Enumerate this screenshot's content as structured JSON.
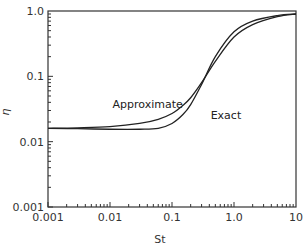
{
  "chart_data": {
    "type": "line",
    "title": "",
    "xlabel": "St",
    "ylabel": "η",
    "xscale": "log",
    "yscale": "log",
    "xlim": [
      0.001,
      10
    ],
    "ylim": [
      0.001,
      1.0
    ],
    "x_ticks": [
      0.001,
      0.01,
      0.1,
      1.0,
      10
    ],
    "x_tick_labels": [
      "0.001",
      "0.01",
      "0.1",
      "1.0",
      "10"
    ],
    "y_ticks": [
      0.001,
      0.01,
      0.1,
      1.0
    ],
    "y_tick_labels": [
      "0.001",
      "0.01",
      "0.1",
      "1.0"
    ],
    "grid": false,
    "legend": "none (curves annotated inline)",
    "series": [
      {
        "name": "Approximate",
        "x": [
          0.001,
          0.003,
          0.01,
          0.03,
          0.06,
          0.1,
          0.15,
          0.2,
          0.3,
          0.5,
          1.0,
          2.0,
          5.0,
          10
        ],
        "y": [
          0.016,
          0.0163,
          0.017,
          0.019,
          0.022,
          0.027,
          0.036,
          0.047,
          0.08,
          0.17,
          0.4,
          0.62,
          0.82,
          0.9
        ]
      },
      {
        "name": "Exact",
        "x": [
          0.001,
          0.003,
          0.01,
          0.03,
          0.06,
          0.1,
          0.15,
          0.2,
          0.3,
          0.5,
          1.0,
          2.0,
          5.0,
          10
        ],
        "y": [
          0.016,
          0.0158,
          0.0155,
          0.0155,
          0.016,
          0.019,
          0.026,
          0.037,
          0.075,
          0.2,
          0.48,
          0.7,
          0.85,
          0.9
        ]
      }
    ],
    "annotations": [
      {
        "text": "Approximate",
        "x": 0.011,
        "y": 0.033
      },
      {
        "text": "Exact",
        "x": 0.42,
        "y": 0.022
      }
    ]
  },
  "axes": {
    "x_label": "St",
    "y_label": "η"
  }
}
